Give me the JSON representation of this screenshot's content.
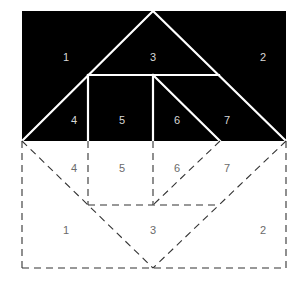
{
  "diagram": {
    "colors": {
      "fill": "#000000",
      "solid_line": "#ffffff",
      "dashed_line": "#333333",
      "label_dark": "#d8d8d8",
      "label_light": "#6a6a6a",
      "background": "#ffffff"
    },
    "top_region": {
      "labels": [
        {
          "id": "1",
          "text": "1",
          "x": 66,
          "y": 57
        },
        {
          "id": "3",
          "text": "3",
          "x": 153,
          "y": 57
        },
        {
          "id": "2",
          "text": "2",
          "x": 263,
          "y": 57
        },
        {
          "id": "4",
          "text": "4",
          "x": 74,
          "y": 120
        },
        {
          "id": "5",
          "text": "5",
          "x": 122,
          "y": 120
        },
        {
          "id": "6",
          "text": "6",
          "x": 177,
          "y": 120
        },
        {
          "id": "7",
          "text": "7",
          "x": 227,
          "y": 120
        }
      ]
    },
    "bottom_region": {
      "labels": [
        {
          "id": "4",
          "text": "4",
          "x": 74,
          "y": 168
        },
        {
          "id": "5",
          "text": "5",
          "x": 122,
          "y": 168
        },
        {
          "id": "6",
          "text": "6",
          "x": 177,
          "y": 168
        },
        {
          "id": "7",
          "text": "7",
          "x": 227,
          "y": 168
        },
        {
          "id": "1",
          "text": "1",
          "x": 66,
          "y": 230
        },
        {
          "id": "3",
          "text": "3",
          "x": 153,
          "y": 230
        },
        {
          "id": "2",
          "text": "2",
          "x": 263,
          "y": 230
        }
      ]
    }
  }
}
